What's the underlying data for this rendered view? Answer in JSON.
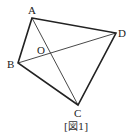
{
  "figure": {
    "caption": "[図1]",
    "points": {
      "A": {
        "label": "A",
        "x": 32,
        "y": 18
      },
      "B": {
        "label": "B",
        "x": 18,
        "y": 63
      },
      "C": {
        "label": "C",
        "x": 78,
        "y": 105
      },
      "D": {
        "label": "D",
        "x": 116,
        "y": 33
      },
      "O": {
        "label": "O"
      }
    },
    "edges": [
      "AB",
      "BC",
      "CD",
      "DA"
    ],
    "diagonals": [
      "AC",
      "BD"
    ],
    "colors": {
      "stroke": "#222222",
      "background": "#ffffff"
    }
  }
}
